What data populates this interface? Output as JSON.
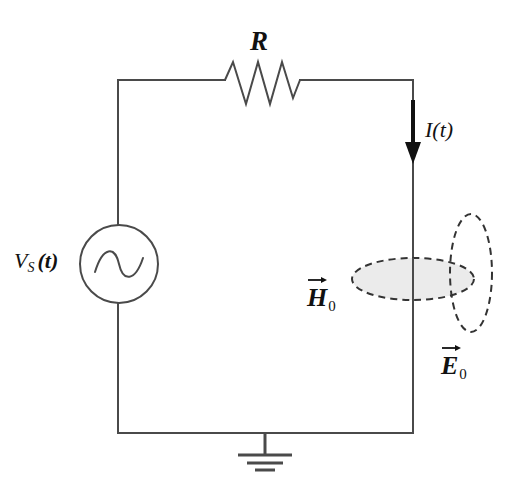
{
  "figure": {
    "background_color": "#ffffff",
    "line_color": "#4a4a4a",
    "label_color": "#111111"
  },
  "labels": {
    "resistor": "R",
    "source_main": "V",
    "source_sub": "S",
    "source_paren": "(t)",
    "current": "I(t)",
    "h_field_glyph": "H",
    "h_field_sub": "0",
    "e_field_glyph": "E",
    "e_field_sub": "0"
  },
  "components": {
    "voltage_source": {
      "name": "ac-voltage-source",
      "shape": "circle-with-sine",
      "center_x": 119,
      "center_y": 264,
      "radius": 39
    },
    "resistor": {
      "name": "resistor",
      "shape": "zigzag",
      "x_start": 225,
      "x_end": 300,
      "baseline_y": 80,
      "peaks": 3
    },
    "current_arrow": {
      "name": "current-arrow",
      "direction": "down",
      "x": 413,
      "y_start": 100,
      "y_end": 162,
      "color": "#111111"
    },
    "ground": {
      "name": "ground-symbol",
      "x": 265,
      "stem_top": 433,
      "bars_y": [
        455,
        463,
        470
      ],
      "bar_widths": [
        54,
        36,
        20
      ]
    },
    "h_field_lobe": {
      "name": "h-field-ellipse",
      "orientation": "horizontal",
      "cx": 413,
      "cy": 279,
      "rx": 61,
      "ry": 21,
      "fill": "#ebebeb",
      "stroke": "#333333",
      "dashed": true
    },
    "e_field_lobe": {
      "name": "e-field-ellipse",
      "orientation": "vertical",
      "cx": 471,
      "cy": 273,
      "rx": 21,
      "ry": 59,
      "fill": "none",
      "stroke": "#333333",
      "dashed": true
    }
  },
  "wires": {
    "left_x": 118,
    "right_x": 413,
    "top_y": 80,
    "bottom_y": 433
  }
}
